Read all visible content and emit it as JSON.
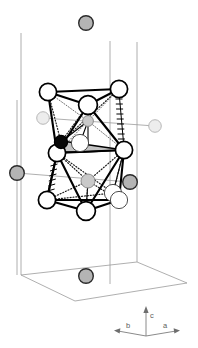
{
  "figure": {
    "background_color": "#ffffff"
  },
  "axes_legend": {
    "name": "crystallographic-axes",
    "axes": [
      {
        "id": "b",
        "label": "b",
        "direction": "left",
        "label_x": 128,
        "label_y": 333
      },
      {
        "id": "c",
        "label": "c",
        "direction": "up",
        "label_x": 149,
        "label_y": 318
      },
      {
        "id": "a",
        "label": "a",
        "direction": "right",
        "label_x": 166,
        "label_y": 333
      }
    ],
    "origin_x": 146,
    "origin_y": 336
  },
  "colors": {
    "cell_edge": "#9a9a9a",
    "bond_solid": "#000000",
    "atom_white_fill": "#ffffff",
    "atom_gray_fill": "#b4b4b4",
    "atom_pale_fill": "#ededed",
    "atom_black_fill": "#080808",
    "face_shade_fill": "#b9b9b9",
    "axis_label": "#5c5c5c"
  },
  "unit_cell": {
    "name": "unit-cell-box",
    "vertical_edges": [
      {
        "x1": 21,
        "y1": 33,
        "x2": 21,
        "y2": 275
      },
      {
        "x1": 110,
        "y1": 41,
        "x2": 110,
        "y2": 284
      },
      {
        "x1": 137,
        "y1": 42,
        "x2": 137,
        "y2": 286
      }
    ],
    "base_polygon": "21,275 75,301 187,283 137,262",
    "top_partial": [
      {
        "x1": 21,
        "y1": 33,
        "x2": 110,
        "y2": 41
      }
    ]
  },
  "atoms": [
    {
      "id": "a01",
      "cx": 86,
      "cy": 23,
      "r": 7.3,
      "style": "gray",
      "name": "atom-gray-top"
    },
    {
      "id": "a02",
      "cx": 48,
      "cy": 92,
      "r": 8.6,
      "style": "white",
      "name": "atom-white-upper-left"
    },
    {
      "id": "a03",
      "cx": 119,
      "cy": 89,
      "r": 8.6,
      "style": "white",
      "name": "atom-white-upper-right"
    },
    {
      "id": "a04",
      "cx": 88,
      "cy": 105,
      "r": 9.4,
      "style": "white",
      "name": "atom-white-apex-top"
    },
    {
      "id": "a05",
      "cx": 43,
      "cy": 118,
      "r": 6.3,
      "style": "pale",
      "name": "atom-pale-left-upper"
    },
    {
      "id": "a06",
      "cx": 88,
      "cy": 121,
      "r": 5.4,
      "style": "gray-soft",
      "name": "atom-gray-interior-upper"
    },
    {
      "id": "a07",
      "cx": 155,
      "cy": 126,
      "r": 6.3,
      "style": "pale",
      "name": "atom-pale-right"
    },
    {
      "id": "a08",
      "cx": 61,
      "cy": 142,
      "r": 6.6,
      "style": "black",
      "name": "atom-black-center"
    },
    {
      "id": "a09",
      "cx": 80,
      "cy": 143,
      "r": 8.6,
      "style": "white-thin",
      "name": "atom-white-interior-mid"
    },
    {
      "id": "a10",
      "cx": 57,
      "cy": 153,
      "r": 8.6,
      "style": "white",
      "name": "atom-white-mid-left"
    },
    {
      "id": "a11",
      "cx": 124,
      "cy": 150,
      "r": 8.6,
      "style": "white",
      "name": "atom-white-mid-right"
    },
    {
      "id": "a12",
      "cx": 17,
      "cy": 173,
      "r": 7.3,
      "style": "gray",
      "name": "atom-gray-left-edge"
    },
    {
      "id": "a13",
      "cx": 88,
      "cy": 181,
      "r": 7.0,
      "style": "gray-soft",
      "name": "atom-gray-interior-lower"
    },
    {
      "id": "a14",
      "cx": 130,
      "cy": 182,
      "r": 7.3,
      "style": "gray",
      "name": "atom-gray-right-edge"
    },
    {
      "id": "a15",
      "cx": 113,
      "cy": 193,
      "r": 8.6,
      "style": "white-thin",
      "name": "atom-white-interior-low"
    },
    {
      "id": "a16",
      "cx": 47,
      "cy": 200,
      "r": 8.6,
      "style": "white",
      "name": "atom-white-lower-left"
    },
    {
      "id": "a17",
      "cx": 119,
      "cy": 200,
      "r": 8.6,
      "style": "white-thin",
      "name": "atom-white-lower-right"
    },
    {
      "id": "a18",
      "cx": 86,
      "cy": 211,
      "r": 9.4,
      "style": "white",
      "name": "atom-white-apex-bottom"
    },
    {
      "id": "a19",
      "cx": 86,
      "cy": 276,
      "r": 7.3,
      "style": "gray",
      "name": "atom-gray-bottom"
    }
  ],
  "bonds": {
    "solid": [
      "48,92 88,105",
      "119,89 88,105",
      "48,92 119,89",
      "48,92 57,153",
      "119,89 124,150",
      "88,105 57,153",
      "88,105 124,150",
      "57,153 124,150",
      "57,153 47,200",
      "124,150 119,200",
      "47,200 86,211",
      "119,200 86,211",
      "47,200 119,200",
      "57,153 86,211",
      "124,150 86,211"
    ],
    "thin": [
      "61,142 80,143",
      "80,143 88,121",
      "88,121 88,105",
      "88,181 88,211",
      "113,193 124,150"
    ],
    "dotted": [
      "48,92 61,142",
      "119,89 61,142",
      "88,105 61,142",
      "57,153 88,121",
      "124,150 88,121",
      "47,200 88,181",
      "119,200 88,181",
      "86,211 88,181",
      "57,153 113,193",
      "47,200 113,193"
    ],
    "hatched": [
      "119,89 124,150"
    ]
  },
  "shaded_faces": [
    {
      "points": "61,142 124,150 80,148 57,153",
      "name": "shaded-triangle-face"
    }
  ]
}
